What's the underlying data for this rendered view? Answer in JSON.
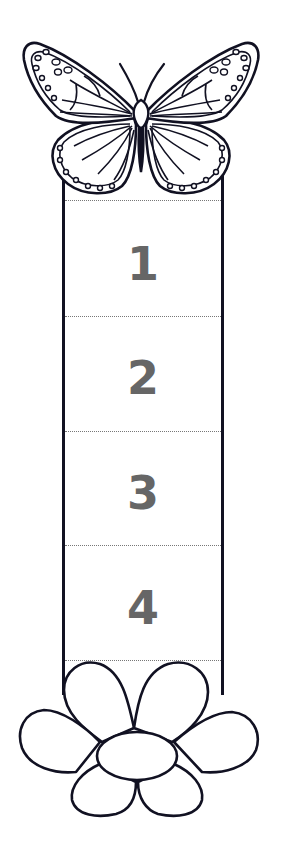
{
  "bookmark": {
    "segments": [
      {
        "label": "1"
      },
      {
        "label": "2"
      },
      {
        "label": "3"
      },
      {
        "label": "4"
      }
    ],
    "top_decoration": "butterfly-icon",
    "bottom_decoration": "flower-icon"
  },
  "colors": {
    "outline": "#111122",
    "number": "#666666",
    "divider": "#777777",
    "background": "#ffffff"
  }
}
